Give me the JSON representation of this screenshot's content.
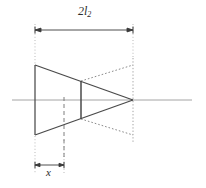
{
  "figure": {
    "title": "",
    "type": "engineering-line-diagram",
    "background_color": "#ffffff",
    "line_color": "#4a4a4a",
    "dotted_color": "#8c8c8c",
    "centerline_color": "#9a9a9a",
    "text_color": "#2b2b2b"
  },
  "labels": {
    "length_symbol": "2l",
    "length_subscript": "2",
    "offset_symbol": "x"
  },
  "dimensions": {
    "top": {
      "name": "2l2",
      "label": "2l₂",
      "x_start": 35,
      "x_end": 133,
      "y": 30
    },
    "bottom": {
      "name": "x",
      "label": "x",
      "x_start": 35,
      "x_end": 64,
      "y": 165
    }
  },
  "geometry": {
    "centerline": {
      "x1": 12,
      "y1": 100,
      "x2": 192,
      "y2": 100
    },
    "left_edge": {
      "x": 35,
      "y_top": 65,
      "y_bottom": 135
    },
    "mid_vertical": {
      "x": 81,
      "y_top": 81,
      "y_bottom": 119
    },
    "apex": {
      "x": 133,
      "y": 100
    },
    "solid_outline": "M35,65 L133,100 L35,135 Z",
    "dotted_outline": "M81,81 L133,65 M81,119 L133,135",
    "dotted_right_vertical": {
      "x": 133,
      "y_top": 60,
      "y_bottom": 140
    },
    "dashed_offset_vertical": {
      "x": 64,
      "y_top": 97,
      "y_bottom": 160
    },
    "extension_left": {
      "x": 35,
      "y_top": 30,
      "y_bottom": 170
    },
    "extension_right": {
      "x": 133,
      "y_top": 30,
      "y_bottom": 60
    }
  }
}
